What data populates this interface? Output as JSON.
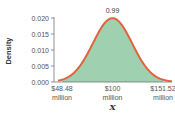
{
  "chart_data": {
    "type": "area",
    "distribution": "normal",
    "mean": 100,
    "sd": 20,
    "title": "",
    "xlabel": "X",
    "ylabel": "Density",
    "ylim": [
      0,
      0.02
    ],
    "xlim": [
      44,
      156
    ],
    "y_ticks": [
      {
        "value": 0.0,
        "label": "0.000"
      },
      {
        "value": 0.005,
        "label": "0.005"
      },
      {
        "value": 0.01,
        "label": "0.010"
      },
      {
        "value": 0.015,
        "label": "0.015"
      },
      {
        "value": 0.02,
        "label": "0.020"
      }
    ],
    "x_ticks": [
      {
        "value": 48.48,
        "line1": "$48.48",
        "line2": "million"
      },
      {
        "value": 100,
        "line1": "$100",
        "line2": "million"
      },
      {
        "value": 151.52,
        "line1": "$151.52",
        "line2": "million"
      }
    ],
    "shaded_region": [
      48.48,
      151.52
    ],
    "annotation": {
      "text": "0.99",
      "meaning": "probability of shaded region"
    },
    "grid": false,
    "colors": {
      "curve": "#e2623b",
      "fill": "#9fd0b0",
      "axis": "#777777"
    }
  }
}
